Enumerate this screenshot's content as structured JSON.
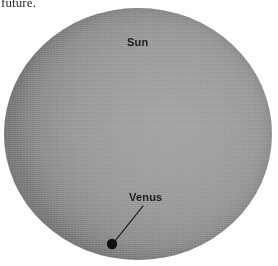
{
  "figure": {
    "kind": "astronomy-diagram",
    "background_color": "#ffffff"
  },
  "caption": {
    "clipped_line": "future."
  },
  "sun": {
    "label": "Sun",
    "fill_color": "#979797",
    "limb_color": "#7c7c7c",
    "center_x": 138,
    "center_y": 134,
    "radius_x": 134,
    "radius_y": 126
  },
  "venus": {
    "label": "Venus",
    "dot_color": "#101010",
    "dot_x": 112,
    "dot_y": 244,
    "dot_radius": 5.2,
    "leader_line": {
      "color": "#111111",
      "width": 1.2,
      "x1": 115,
      "y1": 241,
      "x2": 143,
      "y2": 206
    }
  }
}
